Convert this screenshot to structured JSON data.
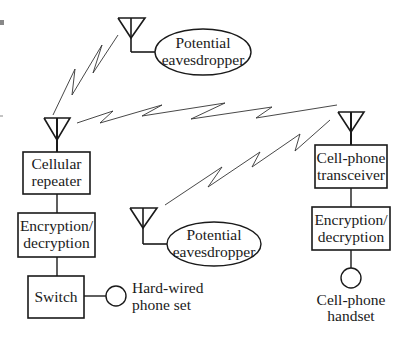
{
  "diagram": {
    "type": "block-diagram",
    "left_chain": {
      "repeater": [
        "Cellular",
        "repeater"
      ],
      "encryption": [
        "Encryption/",
        "decryption"
      ],
      "switch": "Switch",
      "phone": [
        "Hard-wired",
        "phone set"
      ]
    },
    "right_chain": {
      "transceiver": [
        "Cell-phone",
        "transceiver"
      ],
      "encryption": [
        "Encryption/",
        "decryption"
      ],
      "handset": [
        "Cell-phone",
        "handset"
      ]
    },
    "eavesdroppers": [
      {
        "label": [
          "Potential",
          "eavesdropper"
        ],
        "position": "top"
      },
      {
        "label": [
          "Potential",
          "eavesdropper"
        ],
        "position": "middle"
      }
    ],
    "links": [
      {
        "from": "cellular-repeater-antenna",
        "to": "eavesdropper-top-antenna",
        "style": "zigzag"
      },
      {
        "from": "cellular-repeater-antenna",
        "to": "cell-phone-transceiver-antenna",
        "style": "zigzag"
      },
      {
        "from": "eavesdropper-middle-antenna",
        "to": "cell-phone-transceiver-antenna",
        "style": "zigzag"
      }
    ],
    "colors": {
      "line": "#1a1a1a",
      "background": "#ffffff"
    }
  }
}
